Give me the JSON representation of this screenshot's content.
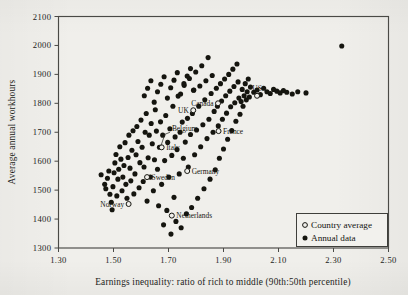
{
  "figure": {
    "background_color": "#f0efeb",
    "ink_color": "#15150f"
  },
  "chart_data": {
    "type": "scatter",
    "title": "",
    "xlabel": "Earnings inequality: ratio of rich to middle (90th:50th percentile)",
    "ylabel": "Average annual workhours",
    "xlim": [
      1.3,
      2.5
    ],
    "ylim": [
      1300,
      2100
    ],
    "xticks": [
      "1.30",
      "1.50",
      "1.70",
      "1.90",
      "2.10",
      "2.30",
      "2.50"
    ],
    "xtick_values": [
      1.3,
      1.5,
      1.7,
      1.9,
      2.1,
      2.3,
      2.5
    ],
    "yticks": [
      "2100",
      "2000",
      "1900",
      "1800",
      "1700",
      "1600",
      "1500",
      "1400",
      "1300"
    ],
    "ytick_values": [
      2100,
      2000,
      1900,
      1800,
      1700,
      1600,
      1500,
      1400,
      1300
    ],
    "grid": false,
    "legend_position": "bottom-right",
    "series": [
      {
        "name": "Annual data",
        "marker": "filled-circle",
        "points": [
          [
            1.455,
            1553
          ],
          [
            1.468,
            1520
          ],
          [
            1.472,
            1505
          ],
          [
            1.478,
            1541
          ],
          [
            1.483,
            1566
          ],
          [
            1.487,
            1486
          ],
          [
            1.492,
            1458
          ],
          [
            1.495,
            1432
          ],
          [
            1.498,
            1512
          ],
          [
            1.502,
            1560
          ],
          [
            1.505,
            1594
          ],
          [
            1.509,
            1623
          ],
          [
            1.512,
            1480
          ],
          [
            1.516,
            1538
          ],
          [
            1.519,
            1572
          ],
          [
            1.523,
            1650
          ],
          [
            1.527,
            1607
          ],
          [
            1.531,
            1498
          ],
          [
            1.534,
            1545
          ],
          [
            1.538,
            1585
          ],
          [
            1.542,
            1664
          ],
          [
            1.545,
            1520
          ],
          [
            1.549,
            1472
          ],
          [
            1.553,
            1613
          ],
          [
            1.556,
            1690
          ],
          [
            1.56,
            1576
          ],
          [
            1.563,
            1532
          ],
          [
            1.567,
            1638
          ],
          [
            1.571,
            1705
          ],
          [
            1.574,
            1487
          ],
          [
            1.578,
            1556
          ],
          [
            1.582,
            1622
          ],
          [
            1.585,
            1720
          ],
          [
            1.589,
            1668
          ],
          [
            1.593,
            1508
          ],
          [
            1.596,
            1595
          ],
          [
            1.6,
            1742
          ],
          [
            1.604,
            1648
          ],
          [
            1.608,
            1530
          ],
          [
            1.611,
            1580
          ],
          [
            1.615,
            1700
          ],
          [
            1.619,
            1765
          ],
          [
            1.622,
            1462
          ],
          [
            1.626,
            1612
          ],
          [
            1.63,
            1690
          ],
          [
            1.634,
            1545
          ],
          [
            1.637,
            1730
          ],
          [
            1.641,
            1660
          ],
          [
            1.645,
            1498
          ],
          [
            1.649,
            1605
          ],
          [
            1.652,
            1778
          ],
          [
            1.656,
            1704
          ],
          [
            1.66,
            1572
          ],
          [
            1.664,
            1446
          ],
          [
            1.667,
            1648
          ],
          [
            1.671,
            1736
          ],
          [
            1.675,
            1520
          ],
          [
            1.679,
            1690
          ],
          [
            1.682,
            1380
          ],
          [
            1.686,
            1602
          ],
          [
            1.69,
            1758
          ],
          [
            1.694,
            1430
          ],
          [
            1.697,
            1665
          ],
          [
            1.701,
            1545
          ],
          [
            1.705,
            1712
          ],
          [
            1.709,
            1348
          ],
          [
            1.712,
            1620
          ],
          [
            1.716,
            1790
          ],
          [
            1.72,
            1475
          ],
          [
            1.724,
            1684
          ],
          [
            1.727,
            1392
          ],
          [
            1.731,
            1640
          ],
          [
            1.735,
            1825
          ],
          [
            1.739,
            1556
          ],
          [
            1.742,
            1700
          ],
          [
            1.746,
            1370
          ],
          [
            1.75,
            1735
          ],
          [
            1.754,
            1610
          ],
          [
            1.757,
            1862
          ],
          [
            1.761,
            1666
          ],
          [
            1.765,
            1418
          ],
          [
            1.769,
            1748
          ],
          [
            1.772,
            1580
          ],
          [
            1.776,
            1886
          ],
          [
            1.78,
            1692
          ],
          [
            1.784,
            1440
          ],
          [
            1.787,
            1765
          ],
          [
            1.791,
            1845
          ],
          [
            1.795,
            1622
          ],
          [
            1.799,
            1908
          ],
          [
            1.802,
            1708
          ],
          [
            1.806,
            1472
          ],
          [
            1.81,
            1790
          ],
          [
            1.814,
            1860
          ],
          [
            1.817,
            1650
          ],
          [
            1.821,
            1930
          ],
          [
            1.825,
            1726
          ],
          [
            1.829,
            1505
          ],
          [
            1.832,
            1812
          ],
          [
            1.836,
            1878
          ],
          [
            1.84,
            1678
          ],
          [
            1.844,
            1958
          ],
          [
            1.847,
            1745
          ],
          [
            1.851,
            1538
          ],
          [
            1.855,
            1834
          ],
          [
            1.859,
            1896
          ],
          [
            1.862,
            1700
          ],
          [
            1.866,
            1772
          ],
          [
            1.87,
            1570
          ],
          [
            1.874,
            1852
          ],
          [
            1.878,
            1790
          ],
          [
            1.881,
            1722
          ],
          [
            1.885,
            1610
          ],
          [
            1.889,
            1868
          ],
          [
            1.893,
            1808
          ],
          [
            1.896,
            1745
          ],
          [
            1.9,
            1642
          ],
          [
            1.904,
            1884
          ],
          [
            1.908,
            1826
          ],
          [
            1.911,
            1766
          ],
          [
            1.915,
            1676
          ],
          [
            1.919,
            1900
          ],
          [
            1.923,
            1842
          ],
          [
            1.926,
            1788
          ],
          [
            1.93,
            1706
          ],
          [
            1.934,
            1918
          ],
          [
            1.938,
            1858
          ],
          [
            1.941,
            1802
          ],
          [
            1.945,
            1738
          ],
          [
            1.949,
            1936
          ],
          [
            1.953,
            1874
          ],
          [
            1.956,
            1818
          ],
          [
            1.96,
            1762
          ],
          [
            1.964,
            1806
          ],
          [
            1.968,
            1848
          ],
          [
            1.971,
            1790
          ],
          [
            1.975,
            1826
          ],
          [
            1.979,
            1868
          ],
          [
            1.983,
            1812
          ],
          [
            1.986,
            1840
          ],
          [
            1.99,
            1884
          ],
          [
            1.994,
            1822
          ],
          [
            1.998,
            1856
          ],
          [
            2.01,
            1838
          ],
          [
            2.022,
            1846
          ],
          [
            2.034,
            1830
          ],
          [
            2.046,
            1852
          ],
          [
            2.058,
            1840
          ],
          [
            2.07,
            1834
          ],
          [
            2.082,
            1848
          ],
          [
            2.094,
            1842
          ],
          [
            2.106,
            1836
          ],
          [
            2.118,
            1844
          ],
          [
            2.13,
            1838
          ],
          [
            2.15,
            1832
          ],
          [
            2.17,
            1840
          ],
          [
            2.2,
            1836
          ],
          [
            2.33,
            1998
          ],
          [
            1.612,
            1826
          ],
          [
            1.624,
            1852
          ],
          [
            1.636,
            1878
          ],
          [
            1.648,
            1804
          ],
          [
            1.66,
            1840
          ],
          [
            1.672,
            1866
          ],
          [
            1.684,
            1892
          ],
          [
            1.696,
            1818
          ],
          [
            1.708,
            1854
          ],
          [
            1.72,
            1880
          ],
          [
            1.732,
            1906
          ],
          [
            1.744,
            1832
          ],
          [
            1.756,
            1868
          ],
          [
            1.768,
            1894
          ],
          [
            1.78,
            1920
          ],
          [
            1.792,
            1846
          ]
        ]
      },
      {
        "name": "Country average",
        "marker": "open-circle",
        "points": [
          {
            "label": "Norway",
            "x": 1.555,
            "y": 1452,
            "label_side": "left"
          },
          {
            "label": "Sweden",
            "x": 1.622,
            "y": 1545,
            "label_side": "right"
          },
          {
            "label": "Netherlands",
            "x": 1.712,
            "y": 1412,
            "label_side": "right"
          },
          {
            "label": "Germany",
            "x": 1.768,
            "y": 1566,
            "label_side": "right"
          },
          {
            "label": "Italy",
            "x": 1.675,
            "y": 1648,
            "label_side": "right"
          },
          {
            "label": "Belgium",
            "x": 1.675,
            "y": 1648,
            "label_side": "leader"
          },
          {
            "label": "UK",
            "x": 1.79,
            "y": 1776,
            "label_side": "left"
          },
          {
            "label": "Canada",
            "x": 1.88,
            "y": 1800,
            "label_side": "left"
          },
          {
            "label": "France",
            "x": 1.882,
            "y": 1704,
            "label_side": "right"
          },
          {
            "label": "US",
            "x": 2.022,
            "y": 1826,
            "label_side": "above"
          }
        ]
      }
    ],
    "annotations": [
      {
        "text": "Belgium",
        "leader": true,
        "from": [
          1.705,
          1700
        ],
        "to": [
          1.672,
          1652
        ]
      }
    ]
  },
  "legend": {
    "items": [
      {
        "label": "Country average",
        "marker": "open-circle"
      },
      {
        "label": "Annual data",
        "marker": "filled-circle"
      }
    ]
  }
}
